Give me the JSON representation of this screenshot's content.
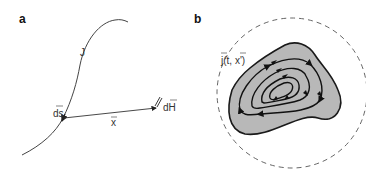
{
  "panels": [
    {
      "label": "a",
      "curve_label": "J",
      "element_label": "ds",
      "position_label": "x",
      "field_label": "dH",
      "description": "Current-carrying wire J with line element ds; position vector x pointing to field contribution dH"
    },
    {
      "label": "b",
      "current_density_label": "j(t, x')",
      "description": "Localized current density distribution with closed circulating current loops, enclosed by dashed boundary circle"
    }
  ],
  "colors": {
    "line": "#333333",
    "blob_fill": "#b8b8b8",
    "blob_stroke": "#1a1a1a",
    "dashed_circle": "#555555"
  }
}
